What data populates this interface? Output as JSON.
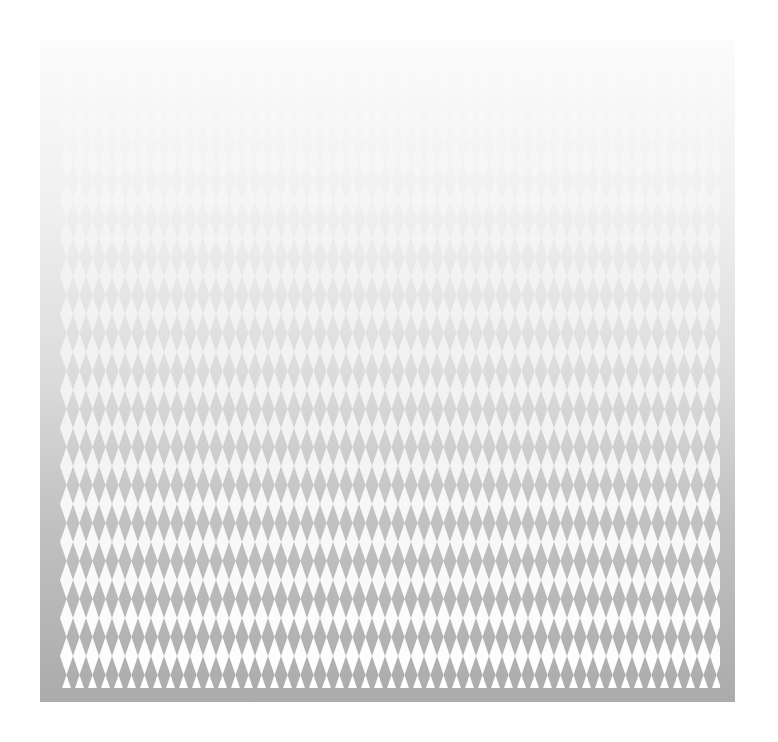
{
  "image": {
    "description": "Abstract halftone pattern of rows of white spike/diamond triangles over a vertical white-to-gray gradient",
    "colors": {
      "background": "#ffffff",
      "gradient_top": "#fbfbfb",
      "gradient_bottom": "#ababab",
      "spike": "#ffffff"
    },
    "band_count": 17,
    "spike_pitch_px": 13
  }
}
